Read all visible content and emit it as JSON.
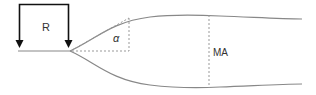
{
  "diagram": {
    "labels": {
      "r": "R",
      "alpha": "α",
      "ma": "MA"
    },
    "colors": {
      "bracket": "#111111",
      "curve": "#888888",
      "dashed": "#999999",
      "text": "#333333"
    }
  }
}
